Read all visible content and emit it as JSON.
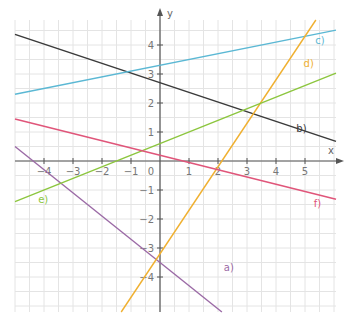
{
  "chart_data": {
    "type": "line",
    "title": "",
    "xlabel": "x",
    "ylabel": "y",
    "xlim": [
      -5.5,
      6
    ],
    "ylim": [
      -5.3,
      5.5
    ],
    "grid": true,
    "grid_step": 0.5,
    "x_ticks": [
      "-4",
      "-3",
      "-2",
      "-1",
      "1",
      "2",
      "3",
      "4",
      "5"
    ],
    "y_ticks": [
      "4",
      "3",
      "2",
      "1",
      "-1",
      "-2",
      "-3",
      "-4"
    ],
    "origin_label": "0",
    "series": [
      {
        "name": "a)",
        "color": "#9b6aa6",
        "slope": -0.8,
        "intercept": -3.5,
        "label_pos": [
          2.2,
          -3.8
        ]
      },
      {
        "name": "b)",
        "color": "#3a3a3a",
        "slope": -0.333,
        "intercept": 2.7,
        "label_pos": [
          4.7,
          1.0
        ]
      },
      {
        "name": "c)",
        "color": "#5bb8d4",
        "slope": 0.2,
        "intercept": 3.3,
        "label_pos": [
          5.35,
          4.05
        ]
      },
      {
        "name": "d)",
        "color": "#f0b030",
        "slope": 1.5,
        "intercept": -3.2,
        "label_pos": [
          4.95,
          3.25
        ]
      },
      {
        "name": "e)",
        "color": "#8cc63e",
        "slope": 0.4,
        "intercept": 0.6,
        "label_pos": [
          -4.2,
          -1.45
        ]
      },
      {
        "name": "f)",
        "color": "#e0557a",
        "slope": -0.25,
        "intercept": 0.2,
        "label_pos": [
          5.3,
          -1.6
        ]
      }
    ]
  }
}
